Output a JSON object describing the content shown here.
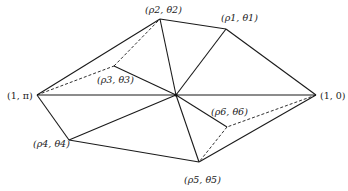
{
  "diagram": {
    "type": "polar triangulation",
    "center": {
      "x": 176,
      "y": 95
    },
    "vertices": [
      {
        "id": "p1",
        "label": "(ρ1, θ1)",
        "x": 226,
        "y": 29,
        "lx": 221,
        "ly": 21
      },
      {
        "id": "p2",
        "label": "(ρ2, θ2)",
        "x": 160,
        "y": 19,
        "lx": 145,
        "ly": 13
      },
      {
        "id": "p3",
        "label": "(ρ3, θ3)",
        "x": 114,
        "y": 66,
        "lx": 97,
        "ly": 83
      },
      {
        "id": "p4",
        "label": "(ρ4, θ4)",
        "x": 69,
        "y": 140,
        "lx": 33,
        "ly": 147
      },
      {
        "id": "p5",
        "label": "(ρ5, θ5)",
        "x": 199,
        "y": 162,
        "lx": 184,
        "ly": 183
      },
      {
        "id": "p6",
        "label": "(ρ6, θ6)",
        "x": 227,
        "y": 127,
        "lx": 211,
        "ly": 115
      },
      {
        "id": "left",
        "label": "(1, π)",
        "x": 37,
        "y": 95,
        "lx": 7,
        "ly": 99
      },
      {
        "id": "right",
        "label": "(1, 0)",
        "x": 316,
        "y": 95,
        "lx": 320,
        "ly": 99
      }
    ],
    "solid_edges": [
      [
        "left",
        "right"
      ],
      [
        "left",
        "p2"
      ],
      [
        "p2",
        "p1"
      ],
      [
        "p1",
        "right"
      ],
      [
        "left",
        "p4"
      ],
      [
        "p4",
        "p5"
      ],
      [
        "p5",
        "right"
      ],
      [
        "center",
        "p2"
      ],
      [
        "center",
        "p1"
      ],
      [
        "center",
        "p3"
      ],
      [
        "center",
        "p4"
      ],
      [
        "center",
        "p5"
      ],
      [
        "center",
        "p6"
      ]
    ],
    "dashed_edges": [
      [
        "left",
        "p3"
      ],
      [
        "p3",
        "p2"
      ],
      [
        "right",
        "p6"
      ],
      [
        "p6",
        "p5"
      ]
    ]
  }
}
